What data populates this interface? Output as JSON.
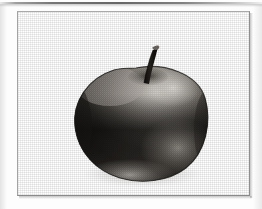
{
  "page": {
    "background_color": "#fdfdfd",
    "scan_edge_color": "#5f5f5f",
    "alt": ""
  },
  "frame": {
    "border_color": "#9d9d9d",
    "fill_color": "#ffffff",
    "x": 17,
    "y": 11,
    "width": 233,
    "height": 185
  },
  "illustration": {
    "subject": "apple",
    "style": "halftone engraving",
    "apple": {
      "center_x": 135,
      "center_y": 113,
      "radius_x": 65,
      "radius_y": 56,
      "body_dark_color": "#2a2724",
      "body_mid_color": "#55514c",
      "shoulder_light_color": "#9e9a94",
      "highlight_color": "#c9c5bf",
      "bottom_glow_color": "#8c8781",
      "edge_color": "#1c1a18"
    },
    "stem": {
      "color": "#1a1715",
      "tip_color": "#6f6a63",
      "top_x": 143,
      "top_y": 34,
      "bottom_x": 134,
      "bottom_y": 72,
      "width": 4
    },
    "shadow": {
      "color": "#b8b4ae",
      "opacity": 0.35
    }
  }
}
